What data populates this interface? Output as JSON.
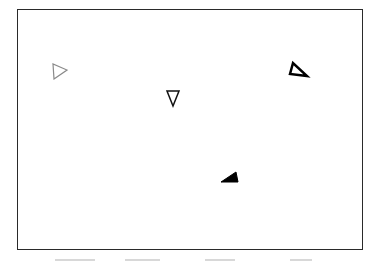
{
  "figure": {
    "frame": {
      "x": 17,
      "y": 9,
      "width": 346,
      "height": 241,
      "stroke": "#2a2a2a"
    },
    "shapes": [
      {
        "id": "triangle-gray-right",
        "type": "triangle",
        "points": "54,79 67,70 53,64",
        "fill": "none",
        "stroke": "#8a8a8a",
        "stroke_width": 1.2
      },
      {
        "id": "triangle-outline-down",
        "type": "triangle",
        "points": "167,91 179,91 173,106",
        "fill": "none",
        "stroke": "#111111",
        "stroke_width": 1.5
      },
      {
        "id": "triangle-bold-outline",
        "type": "triangle",
        "points": "290,74 293,63 307,76",
        "fill": "none",
        "stroke": "#000000",
        "stroke_width": 2.5
      },
      {
        "id": "triangle-filled",
        "type": "triangle",
        "points": "221,182 236,172 238,182",
        "fill": "#000000",
        "stroke": "#000000",
        "stroke_width": 1
      }
    ]
  }
}
